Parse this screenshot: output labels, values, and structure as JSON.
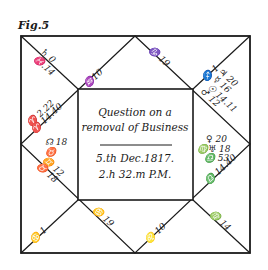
{
  "figure_label": "Fig.5",
  "center": {
    "title_line1": "Question on a",
    "title_line2": "removal of Business",
    "date": "5.th Dec.1817.",
    "time": "2.h 32.m P.M."
  },
  "houses": {
    "h10_top_left": "♒10",
    "h9_top_right": "♑ 19",
    "h12_left_top": "♄ 0",
    "h12_left_top_b": "♓.14",
    "h1_asc": "♈ 2.22",
    "h1_asc_b": "♈ 14.40",
    "h1_planet": "☊ 18",
    "h1_planet_b": "♉",
    "h2_cusp": "♊ 12",
    "h2_cusp_b": "♉ 18",
    "h3_cusp": "♋ 1",
    "h4_cusp": "♋ 19",
    "h5_cusp": "♌ 10",
    "h6_cusp": "♍ 14",
    "h7_cusp": "♎ 14.40",
    "h7_planets_1": "♀ 20",
    "h7_planets_2": "♍♅ 18",
    "h7_planets_3": "♎ 53",
    "h8_cusp": "♐ 1",
    "h8_planets_1": "♃ 20",
    "h8_planets_2": "☿ 16",
    "h8_planets_3": "☉ 14.11",
    "h8_planets_4": "♂ 12"
  }
}
